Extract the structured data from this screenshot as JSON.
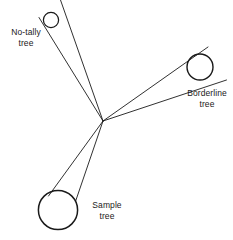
{
  "figure": {
    "type": "line-diagram",
    "background_color": "#ffffff",
    "stroke_color": "#1a1a1a",
    "text_color": "#1a1a1a",
    "labels": {
      "no_tally": "No-tally\ntree",
      "borderline": "Borderline\ntree",
      "sample": "Sample\ntree"
    },
    "caption_partial": "",
    "vertex": {
      "x": 103,
      "y": 121
    },
    "trees": [
      {
        "name": "no-tally-tree",
        "label": "No-tally\ntree",
        "cx": 51,
        "cy": 20,
        "r": 7.5,
        "relation": "outside-angle"
      },
      {
        "name": "borderline-tree",
        "label": "Borderline\ntree",
        "cx": 200,
        "cy": 67,
        "r": 13,
        "relation": "on-angle"
      },
      {
        "name": "sample-tree",
        "label": "Sample\ntree",
        "cx": 58,
        "cy": 210,
        "r": 20,
        "relation": "inside-angle"
      }
    ],
    "sight_lines": [
      {
        "name": "no-tally-upper-ray",
        "x1": 103,
        "y1": 121,
        "x2": 60,
        "y2": 0
      },
      {
        "name": "no-tally-lower-ray",
        "x1": 103,
        "y1": 121,
        "x2": 39,
        "y2": 18
      },
      {
        "name": "borderline-upper-ray",
        "x1": 103,
        "y1": 121,
        "x2": 208,
        "y2": 47
      },
      {
        "name": "borderline-lower-ray",
        "x1": 103,
        "y1": 121,
        "x2": 226,
        "y2": 80
      },
      {
        "name": "sample-left-ray",
        "x1": 103,
        "y1": 121,
        "x2": 49,
        "y2": 196
      },
      {
        "name": "sample-right-ray",
        "x1": 103,
        "y1": 121,
        "x2": 75,
        "y2": 201
      }
    ]
  }
}
